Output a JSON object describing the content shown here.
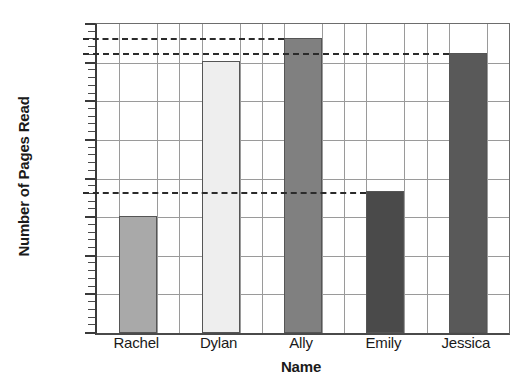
{
  "chart_data": {
    "type": "bar",
    "title": "",
    "xlabel": "Name",
    "ylabel": "Number of Pages Read",
    "categories": [
      "Rachel",
      "Dylan",
      "Ally",
      "Emily",
      "Jessica"
    ],
    "values": [
      76,
      176,
      191,
      92,
      181
    ],
    "bar_colors": [
      "#a9a9a9",
      "#eeeeee",
      "#808080",
      "#4a4a4a",
      "#595959"
    ],
    "ylim": [
      0,
      200
    ],
    "ytick_labels": [
      "0",
      "25",
      "50",
      "75",
      "100",
      "125",
      "150",
      "175",
      "200"
    ],
    "ytick_values": [
      0,
      25,
      50,
      75,
      100,
      125,
      150,
      175,
      200
    ],
    "minor_tick_step": 5,
    "grid": true,
    "legend": "none",
    "annotations": [
      {
        "name": "dashed-reference-high",
        "value": 191,
        "style": "dashed"
      },
      {
        "name": "dashed-reference-mid",
        "value": 181,
        "style": "dashed"
      },
      {
        "name": "dashed-reference-low",
        "value": 91,
        "style": "dashed"
      }
    ]
  }
}
